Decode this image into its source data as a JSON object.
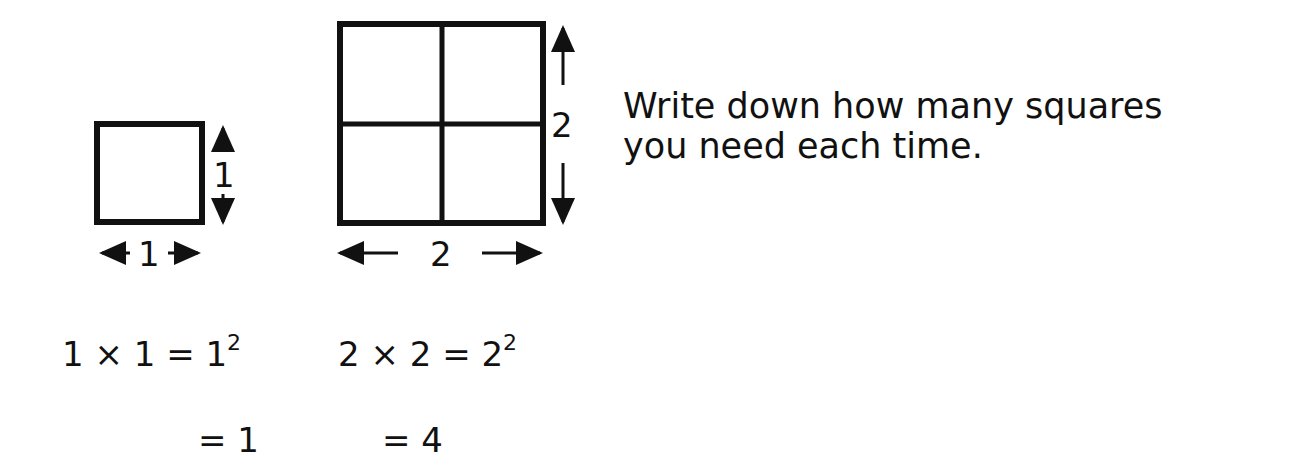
{
  "diagram": {
    "small_square": {
      "side_label_right": "1",
      "side_label_bottom": "1",
      "grid": [
        1,
        1
      ]
    },
    "large_square": {
      "side_label_right": "2",
      "side_label_bottom": "2",
      "grid": [
        2,
        2
      ]
    },
    "equations": {
      "small": {
        "line1_lhs": "1 × 1 = 1",
        "line1_exp": "2",
        "line2": "= 1"
      },
      "large": {
        "line1_lhs": "2 × 2 = 2",
        "line1_exp": "2",
        "line2": "= 4"
      }
    },
    "instruction": {
      "line1": "Write down how many squares",
      "line2": "you need each time."
    },
    "colors": {
      "stroke": "#111111",
      "background": "#ffffff"
    }
  }
}
